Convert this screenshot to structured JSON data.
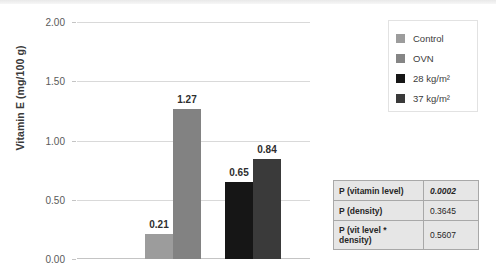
{
  "chart_data": {
    "type": "bar",
    "title": "",
    "xlabel": "",
    "ylabel": "Vitamin E (mg/100 g)",
    "ylim": [
      0,
      2.0
    ],
    "ytick_labels": [
      "0.00",
      "0.50",
      "1.00",
      "1.50",
      "2.00"
    ],
    "ytick_values": [
      0,
      0.5,
      1.0,
      1.5,
      2.0
    ],
    "grid": true,
    "legend_position": "right-top",
    "categories": [
      "28 kg/m²",
      "37 kg/m²"
    ],
    "series": [
      {
        "name": "Control",
        "values": [
          0.21,
          0.65
        ],
        "color": "#9c9c9c"
      },
      {
        "name": "OVN",
        "values": [
          1.27,
          0.84
        ],
        "color": "#808080"
      }
    ],
    "bars": [
      {
        "label": "0.21",
        "value": 0.21,
        "group": "28 kg/m²",
        "series": "Control",
        "color": "#9c9c9c"
      },
      {
        "label": "1.27",
        "value": 1.27,
        "group": "28 kg/m²",
        "series": "OVN",
        "color": "#828282"
      },
      {
        "label": "0.65",
        "value": 0.65,
        "group": "37 kg/m²",
        "series": "Control",
        "color": "#161616"
      },
      {
        "label": "0.84",
        "value": 0.84,
        "group": "37 kg/m²",
        "series": "OVN",
        "color": "#3a3a3a"
      }
    ]
  },
  "legend": {
    "items": [
      {
        "label": "Control",
        "color": "#9c9c9c"
      },
      {
        "label": "OVN",
        "color": "#858585"
      },
      {
        "label": "28 kg/m²",
        "color": "#161616"
      },
      {
        "label": "37 kg/m²",
        "color": "#3a3a3a"
      }
    ]
  },
  "stats_table": {
    "rows": [
      {
        "label": "P (vitamin level)",
        "value": "0.0002",
        "italic": true
      },
      {
        "label": "P (density)",
        "value": "0.3645",
        "italic": false
      },
      {
        "label": "P (vit level * density)",
        "value": "0.5607",
        "italic": false
      }
    ]
  }
}
